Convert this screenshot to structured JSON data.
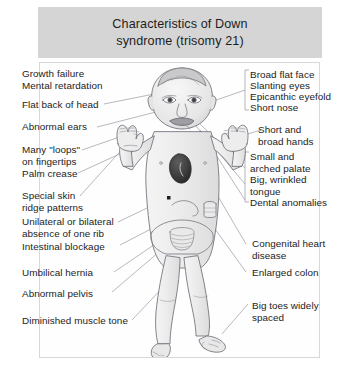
{
  "title": {
    "line1": "Characteristics of Down",
    "line2": "syndrome (trisomy 21)",
    "full": "Characteristics of Down syndrome (trisomy 21)"
  },
  "colors": {
    "banner_background": "#d5d5d5",
    "title_text": "#1d1d1d",
    "frame_border": "#d8d8d8",
    "page_background": "#ffffff",
    "label_text": "#1c1c1c",
    "leader_line": "#8c8c96",
    "outline": "#6e6e78",
    "skin_shade": "#ebebeb",
    "heart_shade": "#3a3a3a"
  },
  "labels": {
    "left": [
      {
        "name": "growth-failure",
        "text": "Growth failure",
        "leader": false
      },
      {
        "name": "mental-retardation",
        "text": "Mental retardation",
        "leader": false
      },
      {
        "name": "flat-back-of-head",
        "text": "Flat back of head",
        "leader": true
      },
      {
        "name": "abnormal-ears",
        "text": "Abnormal ears",
        "leader": true
      },
      {
        "name": "many-loops-on-fingertips",
        "text": "Many \"loops\"\non fingertips",
        "leader": true
      },
      {
        "name": "palm-crease",
        "text": "Palm crease",
        "leader": true
      },
      {
        "name": "special-skin-ridge-patterns",
        "text": "Special skin\nridge patterns",
        "leader": true
      },
      {
        "name": "unilateral-or-bilateral-absence-of-one-rib",
        "text": "Unilateral or bilateral\nabsence of one rib",
        "leader": true
      },
      {
        "name": "intestinal-blockage",
        "text": "Intestinal blockage",
        "leader": true
      },
      {
        "name": "umbilical-hernia",
        "text": "Umbilical hernia",
        "leader": true
      },
      {
        "name": "abnormal-pelvis",
        "text": "Abnormal pelvis",
        "leader": true
      },
      {
        "name": "diminished-muscle-tone",
        "text": "Diminished muscle tone",
        "leader": true
      }
    ],
    "right": [
      {
        "name": "broad-flat-face",
        "text": "Broad flat face",
        "group": 1
      },
      {
        "name": "slanting-eyes",
        "text": "Slanting eyes",
        "group": 1
      },
      {
        "name": "epicanthic-eyefold",
        "text": "Epicanthic eyefold",
        "group": 1
      },
      {
        "name": "short-nose",
        "text": "Short nose",
        "group": 1
      },
      {
        "name": "short-and-broad-hands",
        "text": "Short and\nbroad hands",
        "group": 0
      },
      {
        "name": "small-and-arched-palate",
        "text": "Small and\narched palate",
        "group": 2
      },
      {
        "name": "big-wrinkled-tongue",
        "text": "Big, wrinkled\ntongue",
        "group": 2
      },
      {
        "name": "dental-anomalies",
        "text": "Dental anomalies",
        "group": 2
      },
      {
        "name": "congenital-heart-disease",
        "text": "Congenital heart\ndisease",
        "group": 0
      },
      {
        "name": "enlarged-colon",
        "text": "Enlarged colon",
        "group": 0
      },
      {
        "name": "big-toes-widely-spaced",
        "text": "Big toes widely\nspaced",
        "group": 0
      }
    ]
  },
  "illustration": {
    "subject": "infant-front-view",
    "features": [
      "rounded-head-with-sparse-hair",
      "slanting-eyes",
      "short-flat-nose",
      "open-mouth-protruding-tongue",
      "low-set-ears",
      "raised-open-hands-with-short-broad-fingers",
      "shaded-heart-in-chest",
      "umbilical-area",
      "intestinal-loops-in-abdomen",
      "pelvic-outline",
      "short-bowed-legs",
      "feet-with-widely-spaced-big-toes"
    ]
  }
}
